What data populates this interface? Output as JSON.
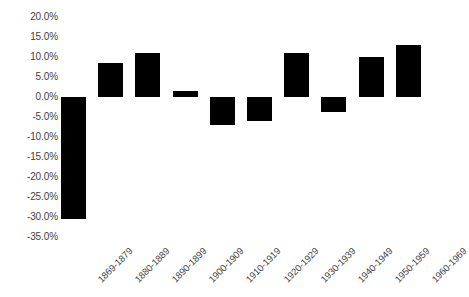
{
  "chart_data": {
    "type": "bar",
    "title": "",
    "xlabel": "",
    "ylabel": "",
    "grid": false,
    "legend": false,
    "bar_color": "#000000",
    "text_color": "#3f3f3f",
    "background": "#ffffff",
    "ylim": [
      -35.0,
      20.0
    ],
    "ytick_step": 5.0,
    "ytick_labels": [
      "20.0%",
      "15.0%",
      "10.0%",
      "5.0%",
      "0.0%",
      "-5.0%",
      "-10.0%",
      "-15.0%",
      "-20.0%",
      "-25.0%",
      "-30.0%",
      "-35.0%"
    ],
    "ytick_values": [
      20.0,
      15.0,
      10.0,
      5.0,
      0.0,
      -5.0,
      -10.0,
      -15.0,
      -20.0,
      -25.0,
      -30.0,
      -35.0
    ],
    "categories": [
      "1869-1879",
      "1880-1889",
      "1890-1899",
      "1900-1909",
      "1910-1919",
      "1920-1929",
      "1930-1939",
      "1940-1949",
      "1950-1959",
      "1960-1969"
    ],
    "values": [
      -30.5,
      8.5,
      11.0,
      1.5,
      -7.0,
      -6.0,
      11.0,
      -3.75,
      10.0,
      13.0
    ]
  }
}
